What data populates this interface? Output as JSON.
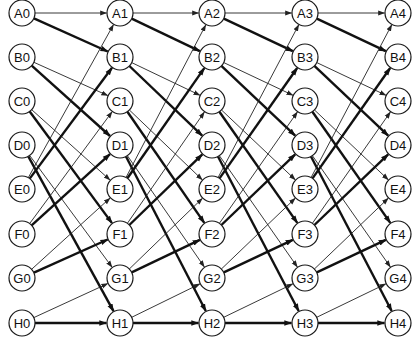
{
  "diagram": {
    "type": "shuffle-exchange network",
    "rows": [
      "A",
      "B",
      "C",
      "D",
      "E",
      "F",
      "G",
      "H"
    ],
    "stages": [
      0,
      1,
      2,
      3,
      4
    ],
    "column_x": [
      22,
      120,
      212,
      305,
      398
    ],
    "row_y": [
      13,
      57,
      101,
      145,
      189,
      234,
      278,
      323
    ],
    "node_radius": 13,
    "edge_rule": "node i in stage s connects to node (2i mod 8) via thin edge and (2i+1 mod 8) via thick edge in stage s+1",
    "colors": {
      "stroke": "#1a1a1a",
      "fill": "#ffffff",
      "text": "#111111"
    },
    "nodes": [
      {
        "id": "A0",
        "label": "A0"
      },
      {
        "id": "B0",
        "label": "B0"
      },
      {
        "id": "C0",
        "label": "C0"
      },
      {
        "id": "D0",
        "label": "D0"
      },
      {
        "id": "E0",
        "label": "E0"
      },
      {
        "id": "F0",
        "label": "F0"
      },
      {
        "id": "G0",
        "label": "G0"
      },
      {
        "id": "H0",
        "label": "H0"
      },
      {
        "id": "A1",
        "label": "A1"
      },
      {
        "id": "B1",
        "label": "B1"
      },
      {
        "id": "C1",
        "label": "C1"
      },
      {
        "id": "D1",
        "label": "D1"
      },
      {
        "id": "E1",
        "label": "E1"
      },
      {
        "id": "F1",
        "label": "F1"
      },
      {
        "id": "G1",
        "label": "G1"
      },
      {
        "id": "H1",
        "label": "H1"
      },
      {
        "id": "A2",
        "label": "A2"
      },
      {
        "id": "B2",
        "label": "B2"
      },
      {
        "id": "C2",
        "label": "C2"
      },
      {
        "id": "D2",
        "label": "D2"
      },
      {
        "id": "E2",
        "label": "E2"
      },
      {
        "id": "F2",
        "label": "F2"
      },
      {
        "id": "G2",
        "label": "G2"
      },
      {
        "id": "H2",
        "label": "H2"
      },
      {
        "id": "A3",
        "label": "A3"
      },
      {
        "id": "B3",
        "label": "B3"
      },
      {
        "id": "C3",
        "label": "C3"
      },
      {
        "id": "D3",
        "label": "D3"
      },
      {
        "id": "E3",
        "label": "E3"
      },
      {
        "id": "F3",
        "label": "F3"
      },
      {
        "id": "G3",
        "label": "G3"
      },
      {
        "id": "H3",
        "label": "H3"
      },
      {
        "id": "A4",
        "label": "A4"
      },
      {
        "id": "B4",
        "label": "B4"
      },
      {
        "id": "C4",
        "label": "C4"
      },
      {
        "id": "D4",
        "label": "D4"
      },
      {
        "id": "E4",
        "label": "E4"
      },
      {
        "id": "F4",
        "label": "F4"
      },
      {
        "id": "G4",
        "label": "G4"
      },
      {
        "id": "H4",
        "label": "H4"
      }
    ],
    "edges_per_stage": [
      {
        "from": "A",
        "thin_to": "A",
        "thick_to": "B"
      },
      {
        "from": "B",
        "thin_to": "C",
        "thick_to": "D"
      },
      {
        "from": "C",
        "thin_to": "E",
        "thick_to": "F"
      },
      {
        "from": "D",
        "thin_to": "G",
        "thick_to": "H"
      },
      {
        "from": "E",
        "thin_to": "A",
        "thick_to": "B"
      },
      {
        "from": "F",
        "thin_to": "C",
        "thick_to": "D"
      },
      {
        "from": "G",
        "thin_to": "E",
        "thick_to": "F"
      },
      {
        "from": "H",
        "thin_to": "G",
        "thick_to": "H"
      }
    ]
  }
}
